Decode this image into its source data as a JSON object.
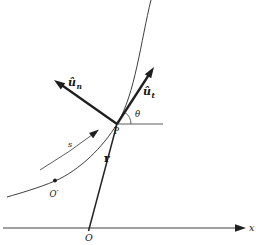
{
  "figure": {
    "background_color": "#ffffff",
    "ink_color": "#1f1f1f",
    "thin_line_color": "#3f3f3f",
    "labels": {
      "unit_normal_base": "û",
      "unit_normal_sub": "n",
      "unit_tangent_base": "û",
      "unit_tangent_sub": "t",
      "angle_theta": "θ",
      "point_p": "P",
      "position_vector_r": "r",
      "arc_length_s": "s",
      "path_reference_point": "O′",
      "origin_o": "O",
      "x_axis": "x"
    }
  }
}
